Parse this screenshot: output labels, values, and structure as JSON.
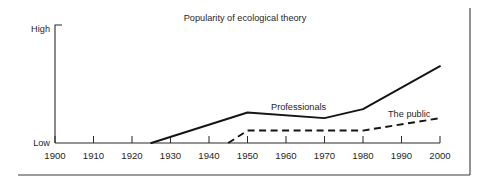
{
  "chart_data": {
    "type": "line",
    "title": "Popularity of ecological theory",
    "xlabel": "",
    "ylabel": "",
    "xlim": [
      1900,
      2000
    ],
    "ylim": [
      0,
      100
    ],
    "grid": false,
    "legend": "inline-annotations",
    "xticks": [
      1900,
      1910,
      1920,
      1930,
      1940,
      1950,
      1960,
      1970,
      1980,
      1990,
      2000
    ],
    "xtick_labels": [
      "1900",
      "1910",
      "1920",
      "1930",
      "1940",
      "1950",
      "1960",
      "1970",
      "1980",
      "1990",
      "2000"
    ],
    "yticks": [
      0,
      100
    ],
    "ytick_labels": [
      "Low",
      "High"
    ],
    "series": [
      {
        "name": "Professionals",
        "style": "solid",
        "color": "#141414",
        "x": [
          1925,
          1950,
          1970,
          1980,
          2000
        ],
        "values": [
          0,
          27,
          22,
          30,
          68
        ]
      },
      {
        "name": "The public",
        "style": "dashed",
        "color": "#141414",
        "x": [
          1945,
          1950,
          1970,
          1980,
          2000
        ],
        "values": [
          0,
          11,
          11,
          11,
          22
        ]
      }
    ],
    "annotations": [
      {
        "text": "Professionals",
        "x": 1958,
        "y": 34
      },
      {
        "text": "The public",
        "x": 1988,
        "y": 31
      }
    ]
  },
  "axes": {
    "y_high_label": "High",
    "y_low_label": "Low"
  },
  "colors": {
    "background": "#ffffff",
    "ink": "#141414",
    "axis": "#2b2b2b",
    "frame": "#3a3a3a"
  }
}
